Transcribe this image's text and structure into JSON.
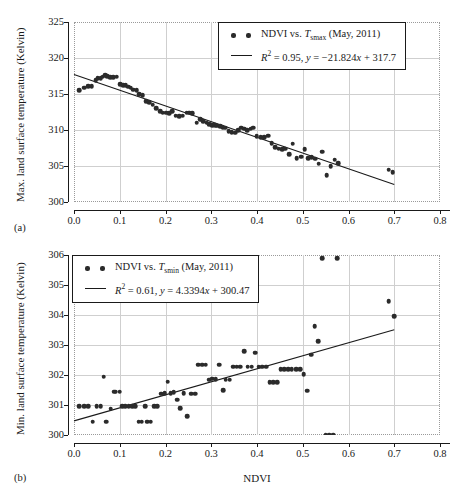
{
  "figure": {
    "panels": [
      {
        "tag": "(a)",
        "ylabel": "Max. land surface temperature (Kelvin)",
        "xlabel": "",
        "legend": {
          "scatter_label_pre": "NDVI vs. ",
          "scatter_symbol": "T",
          "scatter_symbol_sub": "smax",
          "scatter_label_post": " (May, 2011)",
          "fit_label": "R² = 0.95, y = −21.824x + 317.7",
          "fit_r2": "0.95",
          "fit_equation": "y = −21.824x + 317.7"
        }
      },
      {
        "tag": "(b)",
        "ylabel": "Min. land surface temperature (Kelvin)",
        "xlabel": "NDVI",
        "legend": {
          "scatter_label_pre": "NDVI vs. ",
          "scatter_symbol": "T",
          "scatter_symbol_sub": "smin",
          "scatter_label_post": " (May, 2011)",
          "fit_label": "R² = 0.61, y = 4.3394x + 300.47",
          "fit_r2": "0.61",
          "fit_equation": "y = 4.3394x + 300.47"
        }
      }
    ]
  },
  "chart_data": [
    {
      "type": "scatter",
      "panel": "(a)",
      "title": "",
      "xlabel": "NDVI",
      "ylabel": "Max. land surface temperature (Kelvin)",
      "xlim": [
        0.0,
        0.8
      ],
      "ylim": [
        300,
        325
      ],
      "xticks": [
        0.0,
        0.1,
        0.2,
        0.3,
        0.4,
        0.5,
        0.6,
        0.7,
        0.8
      ],
      "xticklabels": [
        "0.0",
        "0.1",
        "0.2",
        "0.3",
        "0.4",
        "0.5",
        "0.6",
        "0.7",
        "0.8"
      ],
      "yticks": [
        300,
        305,
        310,
        315,
        320,
        325
      ],
      "yticklabels": [
        "300",
        "305",
        "310",
        "315",
        "320",
        "325"
      ],
      "grid": true,
      "legend_position": "top-right",
      "series": [
        {
          "name": "NDVI vs. Tsmax (May, 2011)",
          "type": "scatter",
          "x": [
            0.012,
            0.022,
            0.031,
            0.039,
            0.047,
            0.052,
            0.058,
            0.063,
            0.068,
            0.072,
            0.079,
            0.086,
            0.093,
            0.101,
            0.108,
            0.113,
            0.118,
            0.124,
            0.13,
            0.137,
            0.143,
            0.15,
            0.158,
            0.165,
            0.172,
            0.18,
            0.188,
            0.194,
            0.201,
            0.208,
            0.215,
            0.222,
            0.23,
            0.238,
            0.246,
            0.252,
            0.259,
            0.268,
            0.276,
            0.283,
            0.29,
            0.296,
            0.302,
            0.308,
            0.313,
            0.319,
            0.325,
            0.331,
            0.338,
            0.345,
            0.352,
            0.359,
            0.366,
            0.372,
            0.379,
            0.386,
            0.392,
            0.399,
            0.408,
            0.416,
            0.424,
            0.432,
            0.44,
            0.447,
            0.455,
            0.462,
            0.47,
            0.478,
            0.487,
            0.496,
            0.504,
            0.512,
            0.52,
            0.527,
            0.535,
            0.543,
            0.552,
            0.561,
            0.57,
            0.578,
            0.688,
            0.697
          ],
          "y": [
            315.5,
            315.9,
            316.1,
            316.1,
            316.9,
            317.2,
            317.2,
            317.4,
            317.6,
            317.5,
            317.3,
            317.3,
            317.4,
            316.4,
            316.2,
            316.2,
            316.0,
            315.9,
            315.6,
            315.5,
            315.0,
            314.8,
            314.0,
            313.9,
            313.5,
            313.0,
            312.6,
            312.4,
            312.4,
            312.3,
            312.6,
            312.0,
            311.9,
            312.0,
            312.4,
            312.4,
            312.3,
            311.0,
            311.5,
            311.2,
            311.0,
            310.8,
            310.7,
            310.7,
            310.6,
            310.5,
            310.4,
            310.3,
            309.8,
            309.7,
            309.6,
            310.0,
            310.3,
            310.2,
            310.0,
            310.2,
            310.3,
            309.1,
            309.0,
            309.0,
            309.2,
            308.2,
            307.6,
            307.4,
            307.3,
            307.4,
            306.6,
            308.1,
            306.1,
            306.3,
            307.3,
            306.1,
            306.2,
            306.0,
            305.3,
            307.0,
            303.7,
            305.0,
            305.9,
            305.4,
            304.5,
            304.1
          ]
        },
        {
          "name": "Linear fit",
          "type": "line",
          "slope": -21.824,
          "intercept": 317.7,
          "r2": 0.95,
          "x": [
            0.0,
            0.7
          ],
          "y": [
            317.7,
            302.42
          ]
        }
      ]
    },
    {
      "type": "scatter",
      "panel": "(b)",
      "title": "",
      "xlabel": "NDVI",
      "ylabel": "Min. land surface temperature (Kelvin)",
      "xlim": [
        0.0,
        0.8
      ],
      "ylim": [
        300,
        306
      ],
      "xticks": [
        0.0,
        0.1,
        0.2,
        0.3,
        0.4,
        0.5,
        0.6,
        0.7,
        0.8
      ],
      "xticklabels": [
        "0.0",
        "0.1",
        "0.2",
        "0.3",
        "0.4",
        "0.5",
        "0.6",
        "0.7",
        "0.8"
      ],
      "yticks": [
        300,
        301,
        302,
        303,
        304,
        305,
        306
      ],
      "yticklabels": [
        "300",
        "301",
        "302",
        "303",
        "304",
        "305",
        "306"
      ],
      "grid": true,
      "legend_position": "top-left",
      "series": [
        {
          "name": "NDVI vs. Tsmin (May, 2011)",
          "type": "scatter",
          "x": [
            0.012,
            0.022,
            0.031,
            0.041,
            0.05,
            0.058,
            0.065,
            0.07,
            0.08,
            0.088,
            0.091,
            0.1,
            0.106,
            0.112,
            0.12,
            0.127,
            0.134,
            0.141,
            0.148,
            0.155,
            0.16,
            0.168,
            0.175,
            0.182,
            0.19,
            0.198,
            0.205,
            0.211,
            0.218,
            0.226,
            0.232,
            0.24,
            0.248,
            0.256,
            0.265,
            0.272,
            0.28,
            0.288,
            0.295,
            0.302,
            0.31,
            0.318,
            0.326,
            0.332,
            0.34,
            0.348,
            0.356,
            0.363,
            0.372,
            0.38,
            0.388,
            0.396,
            0.404,
            0.412,
            0.42,
            0.428,
            0.436,
            0.444,
            0.452,
            0.46,
            0.468,
            0.476,
            0.486,
            0.494,
            0.502,
            0.51,
            0.518,
            0.526,
            0.534,
            0.542,
            0.55,
            0.558,
            0.566,
            0.575,
            0.688,
            0.7
          ],
          "y": [
            300.96,
            300.96,
            300.96,
            300.45,
            300.96,
            300.96,
            301.95,
            300.45,
            300.88,
            301.45,
            301.45,
            301.45,
            300.96,
            300.96,
            300.96,
            300.96,
            300.96,
            300.45,
            300.45,
            300.96,
            300.45,
            300.45,
            300.96,
            300.96,
            301.38,
            301.4,
            301.78,
            301.4,
            301.42,
            301.17,
            300.9,
            301.4,
            300.62,
            301.38,
            301.38,
            302.35,
            302.35,
            302.35,
            301.85,
            301.88,
            301.86,
            302.35,
            301.5,
            301.85,
            301.85,
            302.28,
            302.28,
            302.28,
            302.8,
            302.28,
            302.28,
            302.75,
            302.28,
            302.28,
            302.28,
            301.76,
            301.76,
            301.76,
            302.2,
            302.2,
            302.2,
            302.2,
            302.2,
            302.2,
            302.02,
            301.48,
            302.67,
            303.62,
            303.12,
            305.9,
            300.0,
            300.0,
            300.0,
            305.9,
            304.46,
            303.96
          ],
          "note": "values cluster at discrete MODIS LST levels"
        },
        {
          "name": "Linear fit",
          "type": "line",
          "slope": 4.3394,
          "intercept": 300.47,
          "r2": 0.61,
          "x": [
            0.0,
            0.7
          ],
          "y": [
            300.47,
            303.51
          ]
        }
      ]
    }
  ]
}
